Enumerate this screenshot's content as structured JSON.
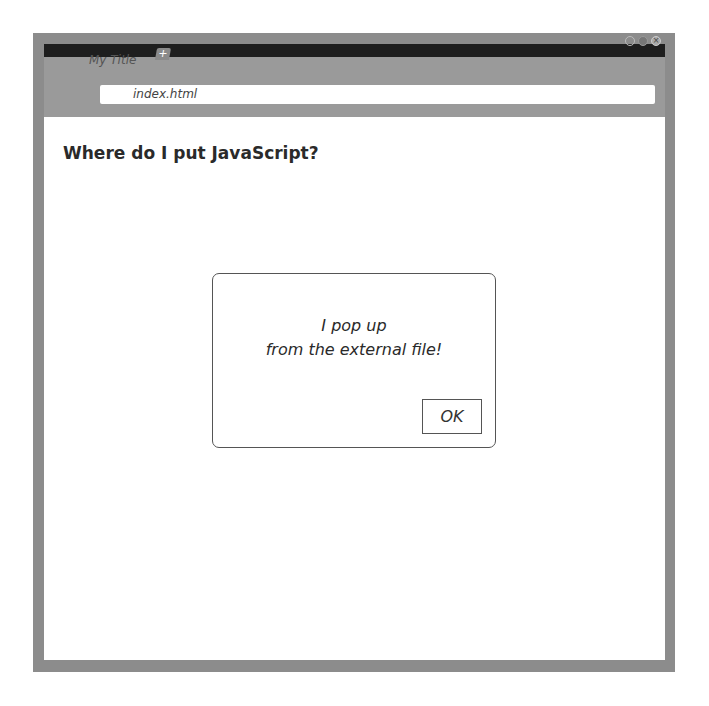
{
  "browser": {
    "tab": {
      "title": "My Title",
      "new_tab_icon": "+"
    },
    "address_bar": {
      "url": "index.html"
    },
    "window_controls": [
      "minimize",
      "maximize",
      "close"
    ],
    "close_glyph": "×"
  },
  "page": {
    "heading": "Where do I put JavaScript?"
  },
  "alert": {
    "line1": "I pop up",
    "line2": "from the external file!",
    "ok_label": "OK"
  }
}
